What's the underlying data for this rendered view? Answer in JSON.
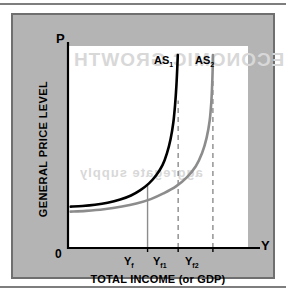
{
  "figure": {
    "background_color": "#ffffff",
    "panel_color": "#b4b4b4",
    "plot_background": "#ffffff"
  },
  "ghost_text": {
    "line1": "ECONOMIC GROWTH",
    "line2": "aggregate supply"
  },
  "axes": {
    "p_label": "P",
    "y_label": "Y",
    "origin_label": "0",
    "y_axis_title": "GENERAL PRICE LEVEL",
    "x_axis_title": "TOTAL INCOME (or GDP)"
  },
  "chart_data": {
    "type": "line",
    "title": "",
    "subtitle": "",
    "xlabel": "TOTAL INCOME (or GDP)",
    "ylabel": "GENERAL PRICE LEVEL",
    "xlim": [
      0,
      10
    ],
    "ylim": [
      0,
      10
    ],
    "grid": false,
    "legend_position": "inline-curve-labels",
    "axis_tick_labels_x": [
      "Y",
      "Y",
      "Y"
    ],
    "annotations": [
      "AS1 becomes vertical at full-employment output Yf1",
      "AS2 is shifted right, becoming vertical at Yf2",
      "Solid gray vertical reference line drawn at Yf"
    ],
    "series": [
      {
        "name": "AS1",
        "label": "AS",
        "label_sub": "1",
        "color": "#000000",
        "line_width": 2.6,
        "style": "solid",
        "description": "Aggregate supply curve, flat at low output then asymptotically vertical",
        "asymptote_x": 6.1,
        "floor_y": 2.05,
        "points": [
          [
            0.15,
            2.05
          ],
          [
            0.8,
            2.08
          ],
          [
            1.5,
            2.14
          ],
          [
            2.2,
            2.24
          ],
          [
            2.9,
            2.4
          ],
          [
            3.5,
            2.6
          ],
          [
            4.0,
            2.85
          ],
          [
            4.5,
            3.2
          ],
          [
            4.9,
            3.6
          ],
          [
            5.25,
            4.1
          ],
          [
            5.5,
            4.7
          ],
          [
            5.7,
            5.4
          ],
          [
            5.85,
            6.2
          ],
          [
            5.95,
            7.1
          ],
          [
            6.02,
            8.0
          ],
          [
            6.07,
            8.9
          ],
          [
            6.1,
            9.55
          ]
        ]
      },
      {
        "name": "AS2",
        "label": "AS",
        "label_sub": "2",
        "color": "#8c8c8c",
        "line_width": 2.6,
        "style": "solid",
        "description": "Rightward-shifted aggregate supply curve",
        "asymptote_x": 8.05,
        "floor_y": 1.8,
        "points": [
          [
            0.15,
            1.8
          ],
          [
            1.0,
            1.84
          ],
          [
            2.0,
            1.92
          ],
          [
            3.0,
            2.05
          ],
          [
            3.8,
            2.2
          ],
          [
            4.6,
            2.42
          ],
          [
            5.3,
            2.7
          ],
          [
            6.0,
            3.05
          ],
          [
            6.6,
            3.5
          ],
          [
            7.1,
            4.05
          ],
          [
            7.45,
            4.7
          ],
          [
            7.7,
            5.45
          ],
          [
            7.87,
            6.3
          ],
          [
            7.96,
            7.2
          ],
          [
            8.01,
            8.1
          ],
          [
            8.04,
            8.95
          ],
          [
            8.05,
            9.55
          ]
        ]
      }
    ],
    "vertical_lines": [
      {
        "name": "Yf",
        "label": "Y",
        "label_sub": "f",
        "x": 4.42,
        "style": "solid",
        "color": "#8c8c8c",
        "width": 1.4,
        "top_y": 3.1
      },
      {
        "name": "Yf1",
        "label": "Y",
        "label_sub": "f1",
        "x": 6.12,
        "style": "dashed",
        "color": "#8c8c8c",
        "width": 1.4,
        "top_y": 7.3
      },
      {
        "name": "Yf2",
        "label": "Y",
        "label_sub": "f2",
        "x": 8.05,
        "style": "dashed",
        "color": "#8c8c8c",
        "width": 1.4,
        "top_y": 8.3
      }
    ]
  },
  "tick_labels": {
    "yf": {
      "base": "Y",
      "sub": "f"
    },
    "yf1": {
      "base": "Y",
      "sub": "f1"
    },
    "yf2": {
      "base": "Y",
      "sub": "f2"
    }
  },
  "curve_labels": {
    "as1": {
      "base": "AS",
      "sub": "1"
    },
    "as2": {
      "base": "AS",
      "sub": "2"
    }
  }
}
